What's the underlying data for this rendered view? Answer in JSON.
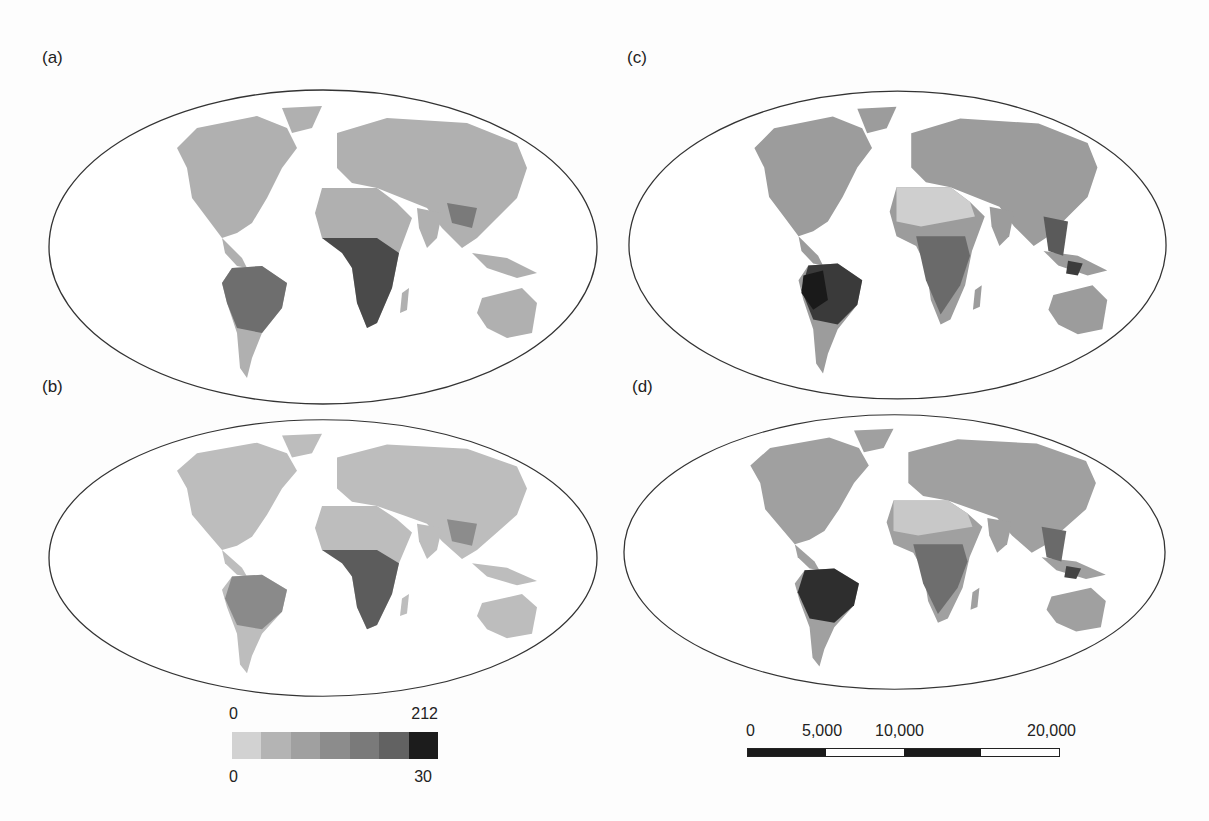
{
  "panels": [
    {
      "id": "a",
      "label": "(a)"
    },
    {
      "id": "b",
      "label": "(b)"
    },
    {
      "id": "c",
      "label": "(c)"
    },
    {
      "id": "d",
      "label": "(d)"
    }
  ],
  "legend": {
    "top_min": "0",
    "top_max": "212",
    "bottom_min": "0",
    "bottom_max": "30",
    "swatches": [
      "#d2d2d2",
      "#b4b4b4",
      "#a0a0a0",
      "#8c8c8c",
      "#7a7a7a",
      "#626262",
      "#1c1c1c"
    ]
  },
  "scale_bar": {
    "labels": [
      "0",
      "5,000",
      "10,000",
      "20,000"
    ],
    "segments": [
      "black",
      "white",
      "black",
      "white"
    ]
  },
  "colors": {
    "ocean": "#ffffff",
    "outline": "#333333",
    "land_light": "#c8c8c8",
    "land_mid": "#9a9a9a",
    "land_dark": "#555555",
    "land_darkest": "#222222"
  }
}
